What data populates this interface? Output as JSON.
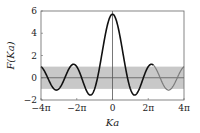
{
  "chart_data": {
    "type": "line",
    "title": "",
    "xlabel": "Ka",
    "ylabel": "F(Ka)",
    "xlim": [
      -12.566,
      12.566
    ],
    "ylim": [
      -2,
      6
    ],
    "x_tick_labels": [
      "−4π",
      "−2π",
      "0",
      "2π",
      "4π"
    ],
    "x_ticks": [
      -12.566,
      -6.283,
      0,
      6.283,
      12.566
    ],
    "y_tick_labels": [
      "−2",
      "0",
      "2",
      "4",
      "6"
    ],
    "y_ticks": [
      -2,
      0,
      2,
      4,
      6
    ],
    "grid": false,
    "legend": null,
    "function": "F(Ka) = (3π/2)·sin(Ka)/(Ka) + cos(Ka)",
    "P": 4.712,
    "shaded_band": {
      "ymin": -1,
      "ymax": 1,
      "color": "#c8c8c8"
    },
    "reference_lines": [
      {
        "axis": "y",
        "value": 0
      },
      {
        "axis": "x",
        "value": 0
      }
    ],
    "series": [
      {
        "name": "F(Ka) black segment",
        "color": "#111111",
        "x_range": [
          -12.566,
          7.2
        ]
      },
      {
        "name": "F(Ka) gray segment",
        "color": "#7a7a7a",
        "x_range": [
          7.2,
          12.566
        ]
      }
    ],
    "sample_points": {
      "x": [
        -12.566,
        -9.425,
        -6.283,
        -4.5,
        -3.142,
        0,
        3.142,
        4.5,
        6.283,
        7.85,
        9.425,
        12.566
      ],
      "y": [
        1.0,
        -1.0,
        1.0,
        -1.24,
        -1.0,
        5.71,
        -1.0,
        -1.24,
        1.0,
        0.6,
        -1.0,
        1.0
      ]
    }
  }
}
